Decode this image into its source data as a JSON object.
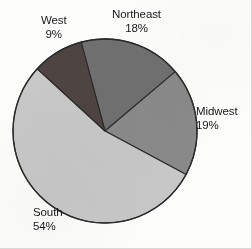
{
  "chart_data": {
    "type": "pie",
    "title": "",
    "subtitle": "",
    "xlabel": "",
    "ylabel": "",
    "legend_position": "none",
    "grid": false,
    "labels_inline": true,
    "value_unit": "%",
    "start_angle_deg": -15,
    "direction": "clockwise",
    "categories": [
      "Northeast",
      "Midwest",
      "South",
      "West"
    ],
    "values": [
      18,
      19,
      54,
      9
    ],
    "slices": [
      {
        "name": "Northeast",
        "label": "Northeast",
        "value": 18,
        "value_text": "18%",
        "color": "#707070",
        "label_position": "top-center"
      },
      {
        "name": "Midwest",
        "label": "Midwest",
        "value": 19,
        "value_text": "19%",
        "color": "#8a8a8a",
        "label_position": "right"
      },
      {
        "name": "South",
        "label": "South",
        "value": 54,
        "value_text": "54%",
        "color": "#c8c8c8",
        "label_position": "bottom-left"
      },
      {
        "name": "West",
        "label": "West",
        "value": 9,
        "value_text": "9%",
        "color": "#4e4442",
        "label_position": "top-left"
      }
    ],
    "total": 100,
    "geometry": {
      "center_x": 105,
      "center_y": 131,
      "radius": 92
    },
    "colors": {
      "background": "#fdfdfc",
      "outline": "#2b2b2b",
      "text": "#16181a"
    }
  }
}
